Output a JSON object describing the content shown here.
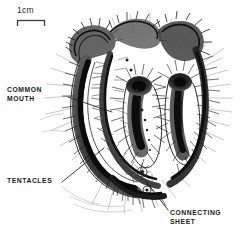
{
  "figure": {
    "kind": "scientific-line-illustration",
    "background_color": "#fefefe",
    "ink_color": "#1a1a1a",
    "width": 247,
    "height": 225
  },
  "scale_bar": {
    "label": "1cm",
    "color": "#2b2b2b"
  },
  "labels": {
    "common_mouth": "COMMON\nMOUTH",
    "tentacles": "TENTACLES",
    "connecting_sheet": "CONNECTING SHEET"
  },
  "leader_lines": [
    {
      "name": "common-mouth-leader",
      "x1": 68,
      "y1": 97,
      "x2": 112,
      "y2": 112
    },
    {
      "name": "tentacles-leader",
      "x1": 62,
      "y1": 182,
      "x2": 104,
      "y2": 148
    },
    {
      "name": "connecting-sheet-leader",
      "x1": 168,
      "y1": 210,
      "x2": 145,
      "y2": 180
    }
  ],
  "anatomy": {
    "arm_count": 4,
    "bud_count": 2,
    "arms": [
      {
        "name": "left-outer-arm",
        "description": "long curved arm sweeping down-left, dense ciliated fringe"
      },
      {
        "name": "upper-left-lobe",
        "description": "crested lobe at top left with ruffled margin"
      },
      {
        "name": "upper-right-lobe",
        "description": "crested lobe at top right, hooked tip"
      },
      {
        "name": "center-arm",
        "description": "vertical club-shaped arm, dark core"
      },
      {
        "name": "right-arm",
        "description": "vertical club-shaped arm with radiating tentacles"
      }
    ],
    "buds": [
      {
        "name": "bud-upper",
        "cx": 142,
        "cy": 172,
        "r": 5
      },
      {
        "name": "bud-lower",
        "cx": 147,
        "cy": 190,
        "r": 4
      }
    ]
  }
}
